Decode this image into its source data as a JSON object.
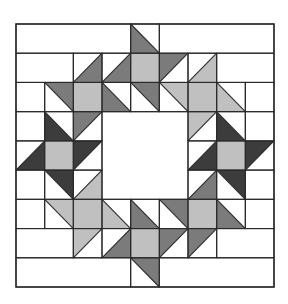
{
  "diagram": {
    "grid": {
      "cols": 9,
      "rows": 9,
      "x0": 16,
      "y0": 24,
      "x1": 274,
      "y1": 287
    },
    "colors": {
      "dark": "#3c3c3c",
      "medium": "#7b7b7b",
      "light": "#c0c0c0",
      "white": "#ffffff",
      "line": "#2a2a2a"
    },
    "merged_white": [
      {
        "row": 0,
        "c0": 0,
        "c1": 3
      },
      {
        "row": 0,
        "c0": 5,
        "c1": 8
      },
      {
        "row": 1,
        "c0": 0,
        "c1": 1
      },
      {
        "row": 1,
        "c0": 7,
        "c1": 8
      },
      {
        "row": 7,
        "c0": 0,
        "c1": 1
      },
      {
        "row": 7,
        "c0": 7,
        "c1": 8
      },
      {
        "row": 8,
        "c0": 0,
        "c1": 3
      },
      {
        "row": 8,
        "c0": 5,
        "c1": 8
      }
    ],
    "center_hole": {
      "r0": 3,
      "r1": 5,
      "c0": 3,
      "c1": 5
    },
    "cells": [
      {
        "r": 0,
        "c": 4,
        "shape": "LL",
        "color": "medium"
      },
      {
        "r": 1,
        "c": 2,
        "shape": "LR",
        "color": "medium"
      },
      {
        "r": 1,
        "c": 3,
        "shape": "LR",
        "color": "medium"
      },
      {
        "r": 1,
        "c": 4,
        "shape": "SQ",
        "color": "light"
      },
      {
        "r": 1,
        "c": 5,
        "shape": "UL",
        "color": "medium"
      },
      {
        "r": 1,
        "c": 6,
        "shape": "LR",
        "color": "light"
      },
      {
        "r": 2,
        "c": 1,
        "shape": "UR",
        "color": "medium"
      },
      {
        "r": 2,
        "c": 2,
        "shape": "SQ",
        "color": "light"
      },
      {
        "r": 2,
        "c": 3,
        "shape": "LL",
        "color": "medium"
      },
      {
        "r": 2,
        "c": 4,
        "shape": "UR",
        "color": "medium"
      },
      {
        "r": 2,
        "c": 5,
        "shape": "UR",
        "color": "light"
      },
      {
        "r": 2,
        "c": 6,
        "shape": "SQ",
        "color": "light"
      },
      {
        "r": 2,
        "c": 7,
        "shape": "LL",
        "color": "light"
      },
      {
        "r": 3,
        "c": 1,
        "shape": "LL",
        "color": "dark"
      },
      {
        "r": 3,
        "c": 2,
        "shape": "UL",
        "color": "medium"
      },
      {
        "r": 3,
        "c": 6,
        "shape": "UL",
        "color": "light"
      },
      {
        "r": 3,
        "c": 7,
        "shape": "LL",
        "color": "dark"
      },
      {
        "r": 4,
        "c": 0,
        "shape": "LR",
        "color": "dark"
      },
      {
        "r": 4,
        "c": 1,
        "shape": "SQ",
        "color": "light"
      },
      {
        "r": 4,
        "c": 2,
        "shape": "UL",
        "color": "dark"
      },
      {
        "r": 4,
        "c": 6,
        "shape": "LR",
        "color": "dark"
      },
      {
        "r": 4,
        "c": 7,
        "shape": "SQ",
        "color": "light"
      },
      {
        "r": 4,
        "c": 8,
        "shape": "UL",
        "color": "dark"
      },
      {
        "r": 5,
        "c": 1,
        "shape": "UR",
        "color": "dark"
      },
      {
        "r": 5,
        "c": 2,
        "shape": "LR",
        "color": "light"
      },
      {
        "r": 5,
        "c": 6,
        "shape": "LR",
        "color": "medium"
      },
      {
        "r": 5,
        "c": 7,
        "shape": "UR",
        "color": "dark"
      },
      {
        "r": 6,
        "c": 1,
        "shape": "UR",
        "color": "light"
      },
      {
        "r": 6,
        "c": 2,
        "shape": "SQ",
        "color": "light"
      },
      {
        "r": 6,
        "c": 3,
        "shape": "LL",
        "color": "light"
      },
      {
        "r": 6,
        "c": 4,
        "shape": "LL",
        "color": "medium"
      },
      {
        "r": 6,
        "c": 5,
        "shape": "UR",
        "color": "medium"
      },
      {
        "r": 6,
        "c": 6,
        "shape": "SQ",
        "color": "light"
      },
      {
        "r": 6,
        "c": 7,
        "shape": "LL",
        "color": "medium"
      },
      {
        "r": 7,
        "c": 2,
        "shape": "UL",
        "color": "light"
      },
      {
        "r": 7,
        "c": 3,
        "shape": "LR",
        "color": "medium"
      },
      {
        "r": 7,
        "c": 4,
        "shape": "SQ",
        "color": "light"
      },
      {
        "r": 7,
        "c": 5,
        "shape": "UL",
        "color": "medium"
      },
      {
        "r": 7,
        "c": 6,
        "shape": "UL",
        "color": "medium"
      },
      {
        "r": 8,
        "c": 4,
        "shape": "UR",
        "color": "medium"
      }
    ]
  }
}
